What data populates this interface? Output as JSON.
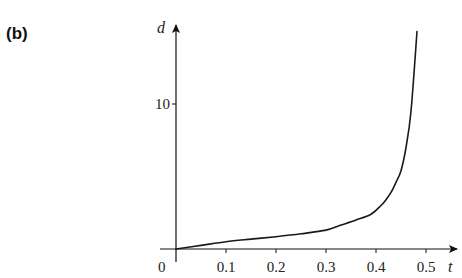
{
  "panel_label": "(b)",
  "chart_data": {
    "type": "line",
    "title": "",
    "xlabel": "t",
    "ylabel": "d",
    "origin_label": "0",
    "xlim": [
      0,
      0.56
    ],
    "ylim": [
      0,
      15.5
    ],
    "xticks": [
      0.1,
      0.2,
      0.3,
      0.4,
      0.5
    ],
    "xtick_labels": [
      "0.1",
      "0.2",
      "0.3",
      "0.4",
      "0.5"
    ],
    "yticks": [
      10
    ],
    "ytick_labels": [
      "10"
    ],
    "grid": false,
    "legend": "none",
    "series": [
      {
        "name": "d(t)",
        "color": "#1a1a1a",
        "x": [
          0,
          0.05,
          0.1,
          0.15,
          0.2,
          0.25,
          0.3,
          0.33,
          0.36,
          0.39,
          0.41,
          0.42,
          0.43,
          0.44,
          0.45,
          0.46,
          0.47,
          0.482
        ],
        "y": [
          0,
          0.25,
          0.5,
          0.68,
          0.85,
          1.05,
          1.3,
          1.65,
          2.0,
          2.4,
          3.0,
          3.4,
          3.9,
          4.6,
          5.4,
          7.0,
          9.5,
          15.0
        ]
      }
    ]
  }
}
